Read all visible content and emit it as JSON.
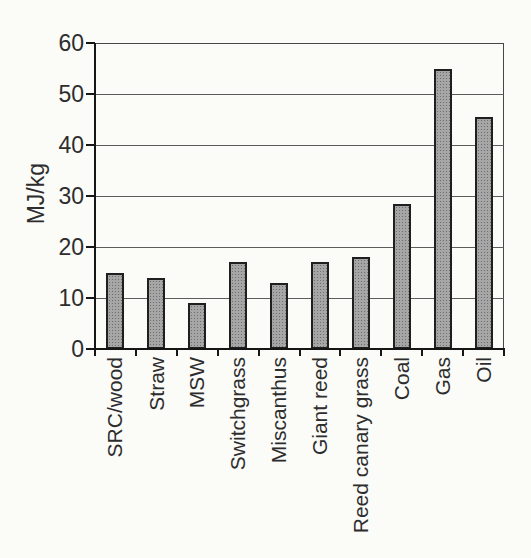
{
  "chart_data": {
    "type": "bar",
    "title": "",
    "xlabel": "",
    "ylabel": "MJ/kg",
    "categories": [
      "SRC/wood",
      "Straw",
      "MSW",
      "Switchgrass",
      "Miscanthus",
      "Giant reed",
      "Reed canary grass",
      "Coal",
      "Gas",
      "Oil"
    ],
    "values": [
      15,
      14,
      9,
      17,
      13,
      17,
      18,
      28.5,
      55,
      45.5
    ],
    "ylim": [
      0,
      60
    ],
    "yticks": [
      0,
      10,
      20,
      30,
      40,
      50,
      60
    ],
    "grid": "horizontal",
    "legend_position": "none",
    "style": {
      "background": "#fbfbf8",
      "text_color": "#2d2d2d",
      "axis_color": "#161616",
      "frame_color": "#474747",
      "grid_color": "#5c5c5c",
      "bar_fill": "#a6a6a6",
      "bar_dot": "#6f6f6f",
      "bar_border": "#1f1f1f"
    }
  }
}
